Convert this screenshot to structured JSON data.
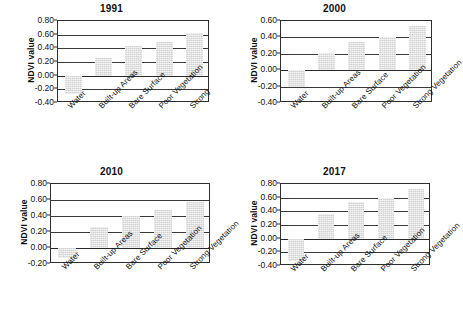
{
  "figure": {
    "ylabel": "NDVI value",
    "categories": [
      "Water",
      "Built-up Areas",
      "Bare Surface",
      "Poor Vegetation",
      "Strong Vegetation"
    ]
  },
  "chart_data": [
    {
      "type": "bar",
      "title": "1991",
      "xlabel": "",
      "ylabel": "NDVI value",
      "categories": [
        "Water",
        "Built-up Areas",
        "Bare Surface",
        "Poor Vegetation",
        "Strong"
      ],
      "values": [
        -0.27,
        0.26,
        0.44,
        0.5,
        0.63
      ],
      "ylim": [
        -0.4,
        0.8
      ],
      "yticks": [
        "0.80",
        "0.60",
        "0.40",
        "0.20",
        "0.00",
        "-0.20",
        "-0.40"
      ],
      "ytick_values": [
        0.8,
        0.6,
        0.4,
        0.2,
        0.0,
        -0.2,
        -0.4
      ],
      "grid": true,
      "legend": "none",
      "bar_color": "#d2d2d2"
    },
    {
      "type": "bar",
      "title": "2000",
      "xlabel": "",
      "ylabel": "NDVI value",
      "categories": [
        "Water",
        "Built-up Areas",
        "Bare Surface",
        "Poor Vegetation",
        "Strong Vegetation"
      ],
      "values": [
        -0.2,
        0.21,
        0.34,
        0.4,
        0.54
      ],
      "ylim": [
        -0.4,
        0.6
      ],
      "yticks": [
        "0.60",
        "0.40",
        "0.20",
        "0.00",
        "-0.20",
        "-0.40"
      ],
      "ytick_values": [
        0.6,
        0.4,
        0.2,
        0.0,
        -0.2,
        -0.4
      ],
      "grid": true,
      "legend": "none",
      "bar_color": "#d2d2d2"
    },
    {
      "type": "bar",
      "title": "2010",
      "xlabel": "",
      "ylabel": "NDVI value",
      "categories": [
        "Water",
        "Built-up Areas",
        "Bare Surface",
        "Poor Vegetation",
        "Strong Vegetation"
      ],
      "values": [
        -0.13,
        0.26,
        0.4,
        0.47,
        0.58
      ],
      "ylim": [
        -0.2,
        0.8
      ],
      "yticks": [
        "0.80",
        "0.60",
        "0.40",
        "0.20",
        "0.00",
        "-0.20"
      ],
      "ytick_values": [
        0.8,
        0.6,
        0.4,
        0.2,
        0.0,
        -0.2
      ],
      "grid": true,
      "legend": "none",
      "bar_color": "#d2d2d2"
    },
    {
      "type": "bar",
      "title": "2017",
      "xlabel": "",
      "ylabel": "NDVI value",
      "categories": [
        "Water",
        "Built-up Areas",
        "Bare Surface",
        "Poor Vegetation",
        "Strong Vegetation"
      ],
      "values": [
        -0.33,
        0.36,
        0.54,
        0.6,
        0.72
      ],
      "ylim": [
        -0.4,
        0.8
      ],
      "yticks": [
        "0.80",
        "0.60",
        "0.40",
        "0.20",
        "0.00",
        "-0.20",
        "-0.40"
      ],
      "ytick_values": [
        0.8,
        0.6,
        0.4,
        0.2,
        0.0,
        -0.2,
        -0.4
      ],
      "grid": true,
      "legend": "none",
      "bar_color": "#d2d2d2"
    }
  ]
}
